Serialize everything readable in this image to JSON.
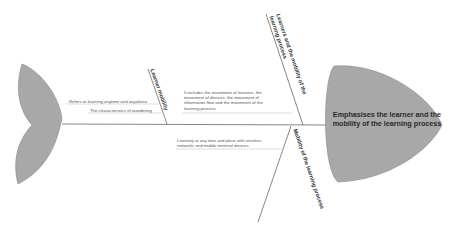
{
  "diagram": {
    "type": "fishbone",
    "head": {
      "label": "Emphasises the learner and the mobility of the learning process",
      "fill": "#a8a8a8"
    },
    "tail": {
      "fill": "#a8a8a8"
    },
    "spine_color": "#555555",
    "bones": [
      {
        "label": "Learner mobility",
        "position": "upper-left",
        "causes": [
          "Refers to learning anytime and anywhere",
          "The characteristics of wandering"
        ]
      },
      {
        "label": "Learners and the mobility of the learning process",
        "label_line1": "Learners and the mobility of the",
        "label_line2": "learning process",
        "position": "upper-right",
        "causes": [
          "It includes the movement of learners, the movement of devices, the movement of information flow and the movement of the learning process"
        ],
        "cause_lines": [
          "It includes the movement of learners, the",
          "movement of devices, the movement of",
          "information flow and the movement of the",
          "learning process"
        ]
      },
      {
        "label": "Mobility of the learning process",
        "position": "lower-right",
        "causes": [
          "Learning at any time and place with wireless networks and mobile terminal devices"
        ],
        "cause_lines": [
          "Learning at any time and place with wireless",
          "networks and mobile terminal devices"
        ]
      }
    ]
  }
}
